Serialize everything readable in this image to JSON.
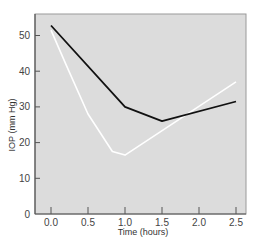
{
  "chart_data": {
    "type": "line",
    "title": "",
    "xlabel": "Time (hours)",
    "ylabel": "IOP (mm Hg)",
    "xlim": [
      -0.2,
      2.65
    ],
    "ylim": [
      0,
      56
    ],
    "x_ticks": [
      0.0,
      0.5,
      1.0,
      1.5,
      2.0,
      2.5
    ],
    "x_tick_labels": [
      "0.0",
      "0.5",
      "1.0",
      "1.5",
      "2.0",
      "2.5"
    ],
    "y_ticks": [
      0,
      10,
      20,
      30,
      40,
      50
    ],
    "y_tick_labels": [
      "0",
      "10",
      "20",
      "30",
      "40",
      "50"
    ],
    "grid": false,
    "legend": null,
    "plot_background": "#dcdcdc",
    "series": [
      {
        "name": "black-line",
        "color": "#111111",
        "x": [
          0.0,
          1.0,
          1.5,
          2.5
        ],
        "y": [
          52.8,
          30.0,
          26.0,
          31.5
        ]
      },
      {
        "name": "white-line",
        "color": "#ffffff",
        "x": [
          0.0,
          0.2,
          0.5,
          0.83,
          1.0,
          2.5
        ],
        "y": [
          51.5,
          42.0,
          28.0,
          17.5,
          16.5,
          37.0
        ]
      }
    ]
  }
}
